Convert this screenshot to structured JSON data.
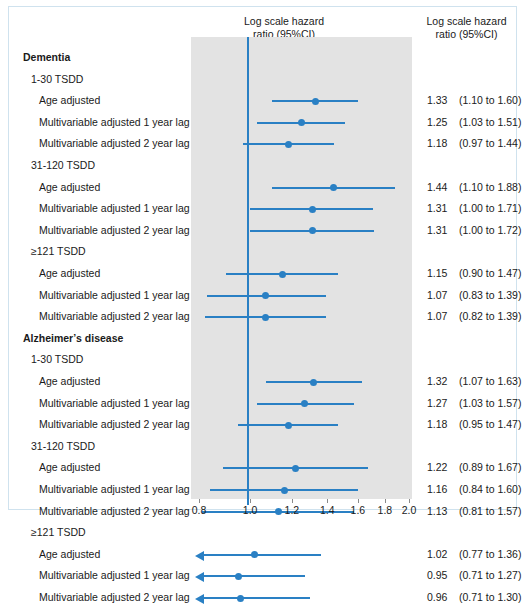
{
  "headers": {
    "plot_column": "Log scale hazard\nratio  (95%CI)",
    "value_column": "Log scale hazard\nratio  (95%CI)"
  },
  "colors": {
    "accent": "#2a80c4",
    "band": "#e3e3e3",
    "frame": "#cfe2ee",
    "text": "#1a1a1a"
  },
  "axis": {
    "ticks": [
      "0.8",
      "1.0",
      "1.2",
      "1.4",
      "1.6",
      "1.8",
      "2.0"
    ],
    "tick_values": [
      0.8,
      1.0,
      1.2,
      1.4,
      1.6,
      1.8,
      2.0
    ],
    "min": 0.8,
    "max": 2.0,
    "scale": "log",
    "reference_line": 1.0
  },
  "chart_data": {
    "type": "forest",
    "title": "Log scale hazard ratio (95%CI)",
    "xlabel": "",
    "ylabel": "",
    "xlim": [
      0.8,
      2.0
    ],
    "scale": "log",
    "reference_line": 1.0,
    "grid": false,
    "legend": "none",
    "rows": [
      {
        "kind": "group",
        "level": 0,
        "label": "Dementia"
      },
      {
        "kind": "subgroup",
        "level": 1,
        "label": "1-30 TSDD"
      },
      {
        "kind": "data",
        "level": 2,
        "label": "Age adjusted",
        "est": 1.33,
        "lo": 1.1,
        "hi": 1.6,
        "est_text": "1.33",
        "ci_text": "(1.10 to 1.60)",
        "arrow_left": false
      },
      {
        "kind": "data",
        "level": 2,
        "label": "Multivariable adjusted 1 year lag",
        "est": 1.25,
        "lo": 1.03,
        "hi": 1.51,
        "est_text": "1.25",
        "ci_text": "(1.03 to 1.51)",
        "arrow_left": false
      },
      {
        "kind": "data",
        "level": 2,
        "label": "Multivariable adjusted 2 year lag",
        "est": 1.18,
        "lo": 0.97,
        "hi": 1.44,
        "est_text": "1.18",
        "ci_text": "(0.97 to 1.44)",
        "arrow_left": false
      },
      {
        "kind": "subgroup",
        "level": 1,
        "label": "31-120 TSDD"
      },
      {
        "kind": "data",
        "level": 2,
        "label": "Age adjusted",
        "est": 1.44,
        "lo": 1.1,
        "hi": 1.88,
        "est_text": "1.44",
        "ci_text": "(1.10 to 1.88)",
        "arrow_left": false
      },
      {
        "kind": "data",
        "level": 2,
        "label": "Multivariable adjusted 1 year lag",
        "est": 1.31,
        "lo": 1.0,
        "hi": 1.71,
        "est_text": "1.31",
        "ci_text": "(1.00 to 1.71)",
        "arrow_left": false
      },
      {
        "kind": "data",
        "level": 2,
        "label": "Multivariable adjusted 2 year lag",
        "est": 1.31,
        "lo": 1.0,
        "hi": 1.72,
        "est_text": "1.31",
        "ci_text": "(1.00 to 1.72)",
        "arrow_left": false
      },
      {
        "kind": "subgroup",
        "level": 1,
        "label": "≥121 TSDD"
      },
      {
        "kind": "data",
        "level": 2,
        "label": "Age adjusted",
        "est": 1.15,
        "lo": 0.9,
        "hi": 1.47,
        "est_text": "1.15",
        "ci_text": "(0.90 to 1.47)",
        "arrow_left": false
      },
      {
        "kind": "data",
        "level": 2,
        "label": "Multivariable adjusted 1 year lag",
        "est": 1.07,
        "lo": 0.83,
        "hi": 1.39,
        "est_text": "1.07",
        "ci_text": "(0.83 to 1.39)",
        "arrow_left": false
      },
      {
        "kind": "data",
        "level": 2,
        "label": "Multivariable adjusted 2 year lag",
        "est": 1.07,
        "lo": 0.82,
        "hi": 1.39,
        "est_text": "1.07",
        "ci_text": "(0.82 to 1.39)",
        "arrow_left": false
      },
      {
        "kind": "group",
        "level": 0,
        "label": "Alzheimerʼs disease"
      },
      {
        "kind": "subgroup",
        "level": 1,
        "label": "1-30 TSDD"
      },
      {
        "kind": "data",
        "level": 2,
        "label": "Age adjusted",
        "est": 1.32,
        "lo": 1.07,
        "hi": 1.63,
        "est_text": "1.32",
        "ci_text": "(1.07 to 1.63)",
        "arrow_left": false
      },
      {
        "kind": "data",
        "level": 2,
        "label": "Multivariable adjusted 1 year lag",
        "est": 1.27,
        "lo": 1.03,
        "hi": 1.57,
        "est_text": "1.27",
        "ci_text": "(1.03 to 1.57)",
        "arrow_left": false
      },
      {
        "kind": "data",
        "level": 2,
        "label": "Multivariable adjusted 2 year lag",
        "est": 1.18,
        "lo": 0.95,
        "hi": 1.47,
        "est_text": "1.18",
        "ci_text": "(0.95 to 1.47)",
        "arrow_left": false
      },
      {
        "kind": "subgroup",
        "level": 1,
        "label": "31-120 TSDD"
      },
      {
        "kind": "data",
        "level": 2,
        "label": "Age adjusted",
        "est": 1.22,
        "lo": 0.89,
        "hi": 1.67,
        "est_text": "1.22",
        "ci_text": "(0.89 to 1.67)",
        "arrow_left": false
      },
      {
        "kind": "data",
        "level": 2,
        "label": "Multivariable adjusted 1 year lag",
        "est": 1.16,
        "lo": 0.84,
        "hi": 1.6,
        "est_text": "1.16",
        "ci_text": "(0.84 to 1.60)",
        "arrow_left": false
      },
      {
        "kind": "data",
        "level": 2,
        "label": "Multivariable adjusted 2 year lag",
        "est": 1.13,
        "lo": 0.81,
        "hi": 1.57,
        "est_text": "1.13",
        "ci_text": "(0.81 to 1.57)",
        "arrow_left": false
      },
      {
        "kind": "subgroup",
        "level": 1,
        "label": "≥121 TSDD"
      },
      {
        "kind": "data",
        "level": 2,
        "label": "Age adjusted",
        "est": 1.02,
        "lo": 0.77,
        "hi": 1.36,
        "est_text": "1.02",
        "ci_text": "(0.77 to 1.36)",
        "arrow_left": true
      },
      {
        "kind": "data",
        "level": 2,
        "label": "Multivariable adjusted 1 year lag",
        "est": 0.95,
        "lo": 0.71,
        "hi": 1.27,
        "est_text": "0.95",
        "ci_text": "(0.71 to 1.27)",
        "arrow_left": true
      },
      {
        "kind": "data",
        "level": 2,
        "label": "Multivariable adjusted 2 year lag",
        "est": 0.96,
        "lo": 0.71,
        "hi": 1.3,
        "est_text": "0.96",
        "ci_text": "(0.71 to 1.30)",
        "arrow_left": true
      }
    ]
  }
}
